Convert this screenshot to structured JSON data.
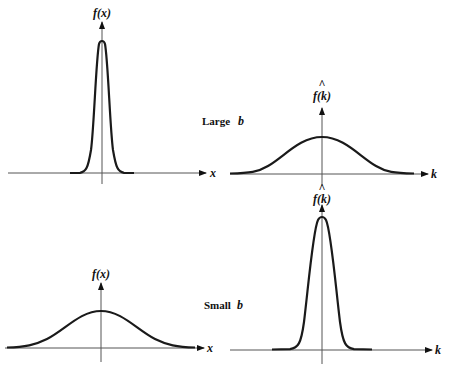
{
  "figure": {
    "rows": [
      {
        "caption_word": "Large",
        "caption_var": "b",
        "left_plot": {
          "y_label": "f(x)",
          "x_label": "x",
          "shape": "narrow-gaussian"
        },
        "right_plot": {
          "y_label_hat": "^",
          "y_label": "f(k)",
          "x_label": "k",
          "shape": "wide-gaussian"
        }
      },
      {
        "caption_word": "Small",
        "caption_var": "b",
        "left_plot": {
          "y_label": "f(x)",
          "x_label": "x",
          "shape": "wide-gaussian"
        },
        "right_plot": {
          "y_label_hat": "^",
          "y_label": "f(k)",
          "x_label": "k",
          "shape": "narrow-gaussian"
        }
      }
    ],
    "colors": {
      "curve": "#1a1a1a",
      "axis": "#555555",
      "background": "#ffffff"
    }
  }
}
